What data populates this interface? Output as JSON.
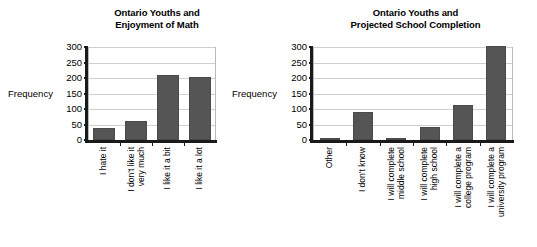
{
  "page": {
    "background": "#ffffff",
    "bar_color": "#555555",
    "grid_color": "#cfcfcf",
    "axis_color": "#1a1a1a"
  },
  "chart_data": [
    {
      "type": "bar",
      "id": "enjoyment-of-math",
      "title": "Ontario Youths and Enjoyment of Math",
      "title_lines": [
        "Ontario Youths and",
        "Enjoyment of Math"
      ],
      "xlabel": "",
      "ylabel": "Frequency",
      "ylim": [
        0,
        300
      ],
      "yticks": [
        0,
        50,
        100,
        150,
        200,
        250,
        300
      ],
      "ytick_labels": [
        "0",
        "50",
        "100",
        "150",
        "200",
        "250",
        "300"
      ],
      "grid": true,
      "legend": "none",
      "categories": [
        "I hate it",
        "I don't like it very much",
        "I like it a bit",
        "I like it a lot"
      ],
      "category_lines": [
        [
          "I hate it"
        ],
        [
          "I don't like it",
          "very much"
        ],
        [
          "I like it a bit"
        ],
        [
          "I like it a lot"
        ]
      ],
      "values": [
        40,
        60,
        210,
        204
      ]
    },
    {
      "type": "bar",
      "id": "projected-school-completion",
      "title": "Ontario Youths and Projected School Completion",
      "title_lines": [
        "Ontario Youths and",
        "Projected School Completion"
      ],
      "xlabel": "",
      "ylabel": "Frequency",
      "ylim": [
        0,
        300
      ],
      "yticks": [
        0,
        50,
        100,
        150,
        200,
        250,
        300
      ],
      "ytick_labels": [
        "0",
        "50",
        "100",
        "150",
        "200",
        "250",
        "300"
      ],
      "grid": true,
      "legend": "none",
      "categories": [
        "Other",
        "I don't know",
        "I will complete middle school",
        "I will complete high school",
        "I will complete a college program",
        "I will complete a university program"
      ],
      "category_lines": [
        [
          "Other"
        ],
        [
          "I don't know"
        ],
        [
          "I will complete",
          "middle school"
        ],
        [
          "I will complete",
          "high school"
        ],
        [
          "I will complete a",
          "college program"
        ],
        [
          "I will complete a",
          "university program"
        ]
      ],
      "values": [
        5,
        90,
        7,
        42,
        112,
        303
      ]
    }
  ]
}
